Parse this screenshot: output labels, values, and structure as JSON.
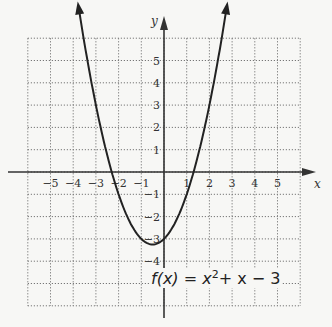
{
  "chart_data": {
    "type": "line",
    "title": "",
    "function_label": "f(x) = x² + x − 3",
    "function_parts": {
      "f": "f(x) = x",
      "exp": "2",
      "rest": "+ x − 3"
    },
    "xlabel": "x",
    "ylabel": "y",
    "xlim": [
      -6,
      6
    ],
    "ylim": [
      -6,
      6
    ],
    "grid": true,
    "x_ticks": [
      "−5",
      "−4",
      "−3",
      "−2",
      "−1",
      "1",
      "2",
      "3",
      "4",
      "5"
    ],
    "y_ticks": [
      "5",
      "4",
      "3",
      "2",
      "1",
      "−1",
      "−2",
      "−3",
      "−4"
    ],
    "series": [
      {
        "name": "f(x) = x^2 + x - 3",
        "x": [
          -3.85,
          -3,
          -2,
          -1,
          -0.5,
          0,
          1,
          2,
          2.85
        ],
        "y": [
          6,
          3,
          -1,
          -3,
          -3.25,
          -3,
          -1,
          3,
          6
        ]
      }
    ],
    "annotations": [
      "arrows at both ends of curve",
      "vertex at (-0.5, -3.25)"
    ]
  }
}
